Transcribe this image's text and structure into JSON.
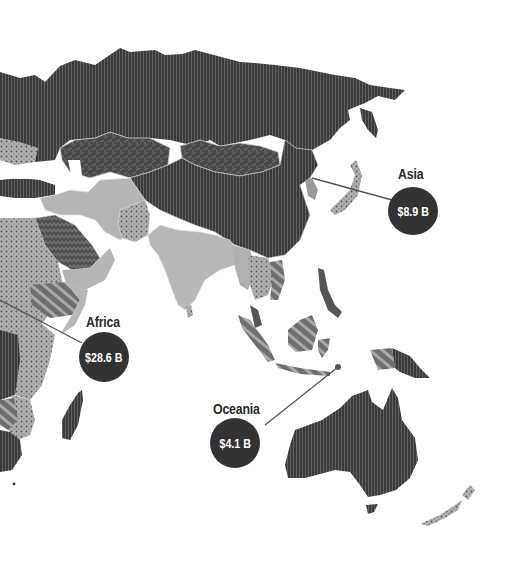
{
  "map": {
    "region_shown": "Asia, Africa, Oceania",
    "colors": {
      "dark_region": "#3a3a3a",
      "medium_region": "#6b6b6b",
      "light_region": "#b8b8b8",
      "dotted_region": "#a5a5a5",
      "hatched_region": "#8a8a8a",
      "bubble": "#333333",
      "bubble_text": "#ffffff",
      "label_text": "#2a2a2a",
      "leader_line": "#555555",
      "background": "#ffffff"
    },
    "callouts": [
      {
        "region": "Asia",
        "value": "$8.9 B"
      },
      {
        "region": "Africa",
        "value": "$28.6 B"
      },
      {
        "region": "Oceania",
        "value": "$4.1 B"
      }
    ]
  }
}
